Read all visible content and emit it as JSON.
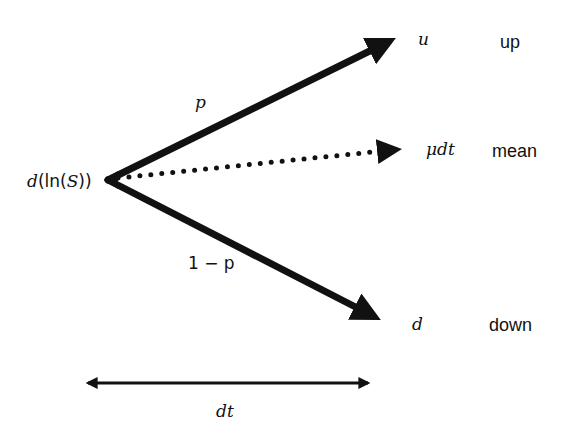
{
  "diagram": {
    "type": "binomial-tree-step",
    "origin_label": "d(ln(S))",
    "origin": {
      "prefix": "d",
      "open": "(",
      "ln": "ln",
      "open2": "(",
      "var": "S",
      "close": "))"
    },
    "branches": [
      {
        "id": "up",
        "probability_label": "p",
        "value_label": "u",
        "description": "up",
        "style": "solid"
      },
      {
        "id": "mean",
        "probability_label": "",
        "value_label": "μdt",
        "description": "mean",
        "style": "dotted"
      },
      {
        "id": "down",
        "probability_label": "1 − p",
        "value_label": "d",
        "description": "down",
        "style": "solid"
      }
    ],
    "time_step": {
      "label": "dt",
      "style": "double-headed"
    }
  }
}
